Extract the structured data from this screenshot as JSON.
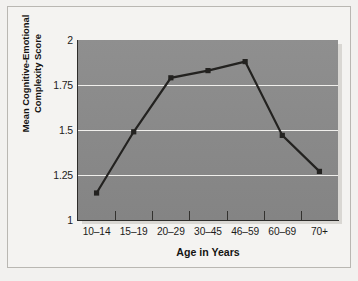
{
  "chart_data": {
    "type": "line",
    "title": "",
    "xlabel": "Age in Years",
    "ylabel": "Mean Cognitive-Emotional Complexity Score",
    "ylabel_line1": "Mean Cognitive-Emotional",
    "ylabel_line2": "Complexity Score",
    "categories": [
      "10–14",
      "15–19",
      "20–29",
      "30–45",
      "46–59",
      "60–69",
      "70+"
    ],
    "values": [
      1.15,
      1.49,
      1.79,
      1.83,
      1.88,
      1.47,
      1.27
    ],
    "ylim": [
      1,
      2
    ],
    "yticks": [
      1,
      1.25,
      1.5,
      1.75,
      2
    ],
    "ytick_labels": [
      "1",
      "1.25",
      "1.5",
      "1.75",
      "2"
    ],
    "grid": true,
    "gridlines_at": [
      1.25,
      1.5,
      1.75
    ],
    "legend": "none",
    "series": [
      {
        "name": "Mean Cognitive-Emotional Complexity Score",
        "values": [
          1.15,
          1.49,
          1.79,
          1.83,
          1.88,
          1.47,
          1.27
        ],
        "line_color": "#232220",
        "marker": "square",
        "marker_color": "#232220"
      }
    ],
    "plot_background": "#8a8a8a",
    "gridline_color": "#f0efec",
    "figure_background": "#f4f3f1",
    "axis_color": "#2e2d2b"
  }
}
